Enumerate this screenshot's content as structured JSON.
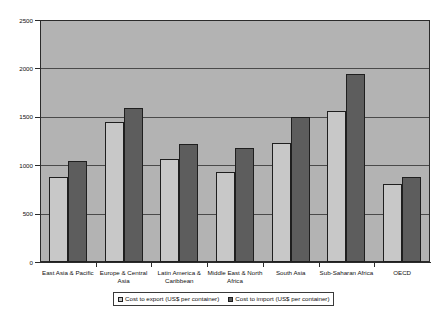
{
  "chart_data": {
    "type": "bar",
    "title": "",
    "xlabel": "",
    "ylabel": "",
    "ylim": [
      0,
      2500
    ],
    "ytick_step": 500,
    "yticks": [
      "0",
      "500",
      "1000",
      "1500",
      "2000",
      "2500"
    ],
    "grid": true,
    "legend_position": "bottom",
    "categories": [
      "East Asia & Pacific",
      "Europe & Central Asia",
      "Latin America & Caribbean",
      "Middle East & North Africa",
      "South Asia",
      "Sub-Saharan Africa",
      "OECD"
    ],
    "series": [
      {
        "name": "Cost to export (US$ per container)",
        "color": "#c8c8c8",
        "values": [
          880,
          1450,
          1060,
          930,
          1230,
          1560,
          810
        ]
      },
      {
        "name": "Cost to import (US$ per container)",
        "color": "#5d5d5d",
        "values": [
          1040,
          1590,
          1220,
          1180,
          1500,
          1940,
          880
        ]
      }
    ]
  },
  "legend": {
    "items": [
      {
        "label": "Cost to export (US$ per container)",
        "swatch": "export-swatch-icon"
      },
      {
        "label": "Cost to import (US$ per container)",
        "swatch": "import-swatch-icon"
      }
    ]
  }
}
